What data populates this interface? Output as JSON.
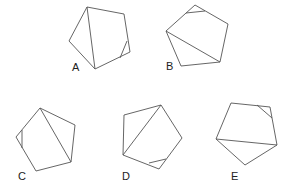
{
  "figure": {
    "type": "pentagon-options",
    "options": [
      {
        "label": "A",
        "label_pos": [
          72,
          71
        ],
        "outline": [
          [
            87,
            7
          ],
          [
            124,
            14
          ],
          [
            130,
            52
          ],
          [
            95,
            69
          ],
          [
            69,
            41
          ]
        ],
        "diagonal": [
          [
            87,
            7
          ],
          [
            95,
            69
          ]
        ],
        "corner_cut": [
          [
            127,
            41
          ],
          [
            120,
            58
          ]
        ]
      },
      {
        "label": "B",
        "label_pos": [
          166,
          70
        ],
        "outline": [
          [
            195,
            5
          ],
          [
            228,
            24
          ],
          [
            220,
            62
          ],
          [
            181,
            66
          ],
          [
            166,
            31
          ]
        ],
        "diagonal": [
          [
            166,
            31
          ],
          [
            220,
            62
          ]
        ],
        "corner_cut": [
          [
            186,
            13
          ],
          [
            205,
            11
          ]
        ]
      },
      {
        "label": "C",
        "label_pos": [
          18,
          180
        ],
        "outline": [
          [
            40,
            108
          ],
          [
            75,
            125
          ],
          [
            71,
            162
          ],
          [
            36,
            171
          ],
          [
            16,
            137
          ]
        ],
        "diagonal": [
          [
            40,
            108
          ],
          [
            71,
            162
          ]
        ],
        "corner_cut": [
          [
            22,
            130
          ],
          [
            22,
            148
          ]
        ]
      },
      {
        "label": "D",
        "label_pos": [
          122,
          180
        ],
        "outline": [
          [
            124,
            115
          ],
          [
            161,
            105
          ],
          [
            182,
            138
          ],
          [
            159,
            169
          ],
          [
            123,
            155
          ]
        ],
        "diagonal": [
          [
            161,
            105
          ],
          [
            123,
            155
          ]
        ],
        "corner_cut": [
          [
            149,
            163
          ],
          [
            166,
            159
          ]
        ]
      },
      {
        "label": "E",
        "label_pos": [
          231,
          180
        ],
        "outline": [
          [
            231,
            103
          ],
          [
            270,
            107
          ],
          [
            277,
            145
          ],
          [
            245,
            165
          ],
          [
            216,
            139
          ]
        ],
        "diagonal": [
          [
            216,
            139
          ],
          [
            277,
            145
          ]
        ],
        "corner_cut": [
          [
            257,
            105
          ],
          [
            272,
            118
          ]
        ]
      }
    ],
    "stroke_color": "#555555",
    "label_color": "#222222"
  }
}
